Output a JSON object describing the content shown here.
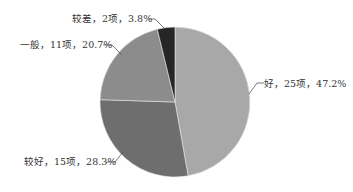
{
  "chart_data": {
    "type": "pie",
    "title": "",
    "start_angle_deg": 0,
    "direction": "clockwise",
    "categories": [
      "好",
      "较好",
      "一般",
      "较差"
    ],
    "counts": [
      25,
      15,
      11,
      2
    ],
    "unit": "项",
    "values": [
      47.2,
      28.3,
      20.7,
      3.8
    ],
    "colors": [
      "#a8a8a8",
      "#6e6e6e",
      "#8c8c8c",
      "#262626"
    ],
    "labels": [
      "好，25项，47.2%",
      "较好，15项，28.3%",
      "一般，11项，20.7%",
      "较差，2项，3.8%"
    ],
    "legend": "none",
    "label_style": "outside with leader lines"
  },
  "labels": {
    "good": "好，25项，47.2%",
    "fairly_good": "较好，15项，28.3%",
    "average": "一般，11项，20.7%",
    "poor": "较差，2项，3.8%"
  }
}
